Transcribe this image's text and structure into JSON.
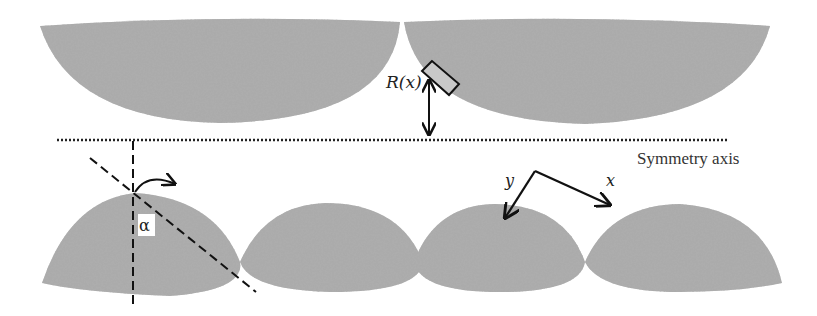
{
  "diagram": {
    "title": "",
    "labels": {
      "roughness_function": "R(x)",
      "symmetry_axis": "Symmetry axis",
      "angle": "α",
      "local_y": "y",
      "local_x": "x"
    },
    "elements": {
      "top_surface": "Upper rough surface composed of two downward-facing circular caps (textured grey)",
      "bottom_surface": "Lower rough surface composed of four upward-facing circular caps (textured grey)",
      "element_box": "Small rectangular surface element on the upper cap near the cusp",
      "distance_arrow": "Double-headed vertical arrow from element to symmetry axis",
      "symmetry_line": "Horizontal dotted line",
      "normal_line": "Vertical dashed line through top of first lower cap",
      "tilted_line": "Dashed line tilted by angle α",
      "rotation_arrow": "Curved arrow indicating rotation",
      "local_axes": "Local coordinate axes x and y"
    },
    "colors": {
      "fill": "#a8a8a8",
      "fill_dark": "#6f6f6f",
      "line": "#111111",
      "box_fill": "#c8c8c8"
    }
  }
}
